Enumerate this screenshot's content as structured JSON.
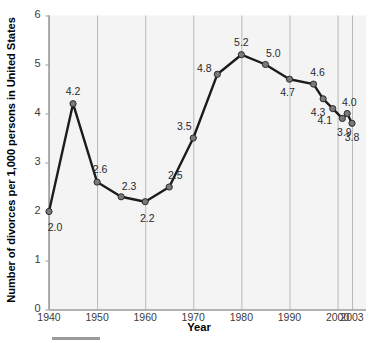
{
  "chart_data": {
    "type": "line",
    "title": "",
    "xlabel": "Year",
    "ylabel": "Number of divorces per 1,000 persons in United States",
    "xlim": [
      1940,
      2003
    ],
    "ylim": [
      0,
      6
    ],
    "xticks": [
      "1940",
      "1950",
      "1960",
      "1970",
      "1980",
      "1990",
      "2000",
      "2003"
    ],
    "xtick_values": [
      1940,
      1950,
      1960,
      1970,
      1980,
      1990,
      2000,
      2003
    ],
    "yticks": [
      "0",
      "1",
      "2",
      "3",
      "4",
      "5",
      "6"
    ],
    "ytick_values": [
      0,
      1,
      2,
      3,
      4,
      5,
      6
    ],
    "grid": "vertical",
    "legend": "none",
    "x": [
      1940,
      1945,
      1950,
      1955,
      1960,
      1965,
      1970,
      1975,
      1980,
      1985,
      1990,
      1995,
      1997,
      1999,
      2001,
      2002,
      2003
    ],
    "values": [
      2.0,
      4.2,
      2.6,
      2.3,
      2.2,
      2.5,
      3.5,
      4.8,
      5.2,
      5.0,
      4.7,
      4.6,
      4.3,
      4.1,
      3.9,
      4.0,
      3.8
    ],
    "point_labels": [
      "2.0",
      "4.2",
      "2.6",
      "2.3",
      "2.2",
      "2.5",
      "3.5",
      "4.8",
      "5.2",
      "5.0",
      "4.7",
      "4.6",
      "4.3",
      "4.1",
      "3.9",
      "4.0",
      "3.8"
    ],
    "label_offsets": [
      {
        "dx": 6,
        "dy": 15
      },
      {
        "dx": 0,
        "dy": -13
      },
      {
        "dx": 3,
        "dy": -13
      },
      {
        "dx": 8,
        "dy": -11
      },
      {
        "dx": 2,
        "dy": 16
      },
      {
        "dx": 6,
        "dy": -12
      },
      {
        "dx": -9,
        "dy": -12
      },
      {
        "dx": -13,
        "dy": -6
      },
      {
        "dx": 0,
        "dy": -13
      },
      {
        "dx": 8,
        "dy": -12
      },
      {
        "dx": -2,
        "dy": 13
      },
      {
        "dx": 4,
        "dy": -12
      },
      {
        "dx": -5,
        "dy": 13
      },
      {
        "dx": -8,
        "dy": 11
      },
      {
        "dx": 2,
        "dy": 14
      },
      {
        "dx": 2,
        "dy": -12
      },
      {
        "dx": 0,
        "dy": 14
      }
    ],
    "colors": {
      "line": "#1c1c1c",
      "marker_fill": "#7a7a7a",
      "marker_edge": "#2b2b2b",
      "plot_background": "#f4f4f4",
      "gridline": "#b9b9b9",
      "axis": "#9a9a9a",
      "text": "#000000",
      "tick_text": "#3b3b3b"
    }
  },
  "footer": {
    "rule_name": "footer-rule"
  }
}
